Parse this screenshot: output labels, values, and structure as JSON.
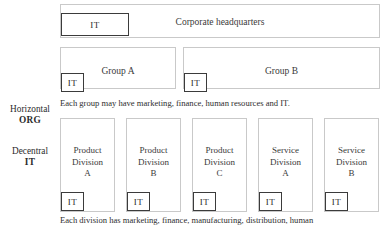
{
  "diagram": {
    "colors": {
      "unit_border": "#c9c9c9",
      "it_border": "#3b3b3b",
      "text": "#2b2b2b",
      "background": "#ffffff"
    },
    "side_labels": [
      {
        "line1": "Horizontal",
        "line2": "ORG"
      },
      {
        "line1": "Decentral",
        "line2": "IT"
      }
    ],
    "headquarters": {
      "label": "Corporate headquarters",
      "it_label": "IT"
    },
    "groups": [
      {
        "label": "Group A",
        "it_label": "IT"
      },
      {
        "label": "Group B",
        "it_label": "IT"
      }
    ],
    "group_caption": "Each group may have marketing, finance, human resources and IT.",
    "divisions": [
      {
        "line1": "Product",
        "line2": "Division",
        "line3": "A",
        "it_label": "IT"
      },
      {
        "line1": "Product",
        "line2": "Division",
        "line3": "B",
        "it_label": "IT"
      },
      {
        "line1": "Product",
        "line2": "Division",
        "line3": "C",
        "it_label": "IT"
      },
      {
        "line1": "Service",
        "line2": "Division",
        "line3": "A",
        "it_label": "IT"
      },
      {
        "line1": "Service",
        "line2": "Division",
        "line3": "B",
        "it_label": "IT"
      }
    ],
    "division_caption": "Each division has marketing, finance, manufacturing, distribution, human"
  }
}
